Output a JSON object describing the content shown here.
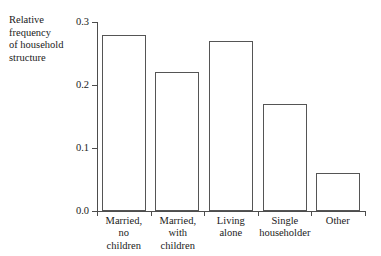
{
  "chart_data": {
    "type": "bar",
    "title": "",
    "ylabel": "Relative frequency of household structure",
    "xlabel": "",
    "categories": [
      "Married, no children",
      "Married, with children",
      "Living alone",
      "Single householder",
      "Other"
    ],
    "values": [
      0.28,
      0.22,
      0.27,
      0.17,
      0.06
    ],
    "ylim": [
      0.0,
      0.3
    ],
    "yticks": [
      0.0,
      0.1,
      0.2,
      0.3
    ],
    "ytick_labels": [
      "0.0",
      "0.1",
      "0.2",
      "0.3"
    ],
    "grid": false,
    "legend": null,
    "bar_fill": "#ffffff",
    "bar_edge": "#555555",
    "axis_color": "#4d4d4d",
    "background": "#ffffff"
  },
  "axis_title": {
    "line1": "Relative",
    "line2": "frequency",
    "line3": "of household",
    "line4": "structure"
  },
  "category_labels": [
    {
      "line1": "Married,",
      "line2": "no",
      "line3": "children"
    },
    {
      "line1": "Married,",
      "line2": "with",
      "line3": "children"
    },
    {
      "line1": "Living",
      "line2": "alone",
      "line3": ""
    },
    {
      "line1": "Single",
      "line2": "householder",
      "line3": ""
    },
    {
      "line1": "Other",
      "line2": "",
      "line3": ""
    }
  ]
}
